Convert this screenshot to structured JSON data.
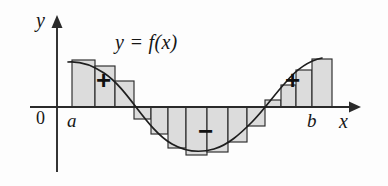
{
  "figure": {
    "equation_label": "y = f(x)",
    "axis": {
      "y_label": "y",
      "x_label": "x",
      "origin_label": "0",
      "lower_limit_label": "a",
      "upper_limit_label": "b"
    },
    "region_signs": {
      "left_positive": "+",
      "right_positive": "+",
      "middle_negative": "−"
    },
    "colors": {
      "bar_fill": "#dcdcdc",
      "bar_stroke": "#2b2b2b",
      "curve_stroke": "#1e1e1e",
      "axis_stroke": "#2a2a2a",
      "text": "#161616",
      "background": "#fdfdfd"
    }
  },
  "chart_data": {
    "type": "area",
    "title": "y = f(x)",
    "xlabel": "x",
    "ylabel": "y",
    "grid": false,
    "legend": false,
    "axis_baseline": 107,
    "x_axis_pixel_range": [
      30,
      355
    ],
    "y_axis_pixel_x": 57,
    "interval": {
      "a_pixel": 72,
      "b_pixel": 318
    },
    "curve_description": "Smooth sinusoid: positive hump from a, crossing down to a negative trough, rising back positive near b",
    "curve_points": [
      {
        "x": 72,
        "y": 62
      },
      {
        "x": 86,
        "y": 64
      },
      {
        "x": 100,
        "y": 70
      },
      {
        "x": 114,
        "y": 79
      },
      {
        "x": 128,
        "y": 92
      },
      {
        "x": 140,
        "y": 107
      },
      {
        "x": 152,
        "y": 121
      },
      {
        "x": 166,
        "y": 135
      },
      {
        "x": 182,
        "y": 146
      },
      {
        "x": 198,
        "y": 151
      },
      {
        "x": 214,
        "y": 150
      },
      {
        "x": 230,
        "y": 143
      },
      {
        "x": 246,
        "y": 131
      },
      {
        "x": 262,
        "y": 117
      },
      {
        "x": 274,
        "y": 107
      },
      {
        "x": 286,
        "y": 95
      },
      {
        "x": 300,
        "y": 79
      },
      {
        "x": 312,
        "y": 66
      },
      {
        "x": 322,
        "y": 60
      }
    ],
    "bars": [
      {
        "index": 1,
        "region": "positive-left",
        "x_left": 72,
        "x_right": 95,
        "top": 60,
        "bottom": 107,
        "signed_height": 47
      },
      {
        "index": 2,
        "region": "positive-left",
        "x_left": 95,
        "x_right": 115,
        "top": 66,
        "bottom": 107,
        "signed_height": 41
      },
      {
        "index": 3,
        "region": "positive-left",
        "x_left": 115,
        "x_right": 134,
        "top": 81,
        "bottom": 107,
        "signed_height": 26
      },
      {
        "index": 4,
        "region": "negative",
        "x_left": 134,
        "x_right": 151,
        "top": 107,
        "bottom": 119,
        "signed_height": -12
      },
      {
        "index": 5,
        "region": "negative",
        "x_left": 151,
        "x_right": 168,
        "top": 107,
        "bottom": 134,
        "signed_height": -27
      },
      {
        "index": 6,
        "region": "negative",
        "x_left": 168,
        "x_right": 186,
        "top": 107,
        "bottom": 148,
        "signed_height": -41
      },
      {
        "index": 7,
        "region": "negative",
        "x_left": 186,
        "x_right": 207,
        "top": 107,
        "bottom": 155,
        "signed_height": -48
      },
      {
        "index": 8,
        "region": "negative",
        "x_left": 207,
        "x_right": 228,
        "top": 107,
        "bottom": 152,
        "signed_height": -45
      },
      {
        "index": 9,
        "region": "negative",
        "x_left": 228,
        "x_right": 247,
        "top": 107,
        "bottom": 142,
        "signed_height": -35
      },
      {
        "index": 10,
        "region": "negative",
        "x_left": 247,
        "x_right": 265,
        "top": 107,
        "bottom": 126,
        "signed_height": -19
      },
      {
        "index": 11,
        "region": "positive-right",
        "x_left": 265,
        "x_right": 281,
        "top": 100,
        "bottom": 107,
        "signed_height": 7
      },
      {
        "index": 12,
        "region": "positive-right",
        "x_left": 281,
        "x_right": 296,
        "top": 85,
        "bottom": 107,
        "signed_height": 22
      },
      {
        "index": 13,
        "region": "positive-right",
        "x_left": 296,
        "x_right": 312,
        "top": 70,
        "bottom": 107,
        "signed_height": 37
      },
      {
        "index": 14,
        "region": "positive-right",
        "x_left": 312,
        "x_right": 332,
        "top": 59,
        "bottom": 107,
        "signed_height": 48
      }
    ],
    "annotations": [
      {
        "text": "+",
        "x": 105,
        "y": 80,
        "meaning": "positive signed area left"
      },
      {
        "text": "−",
        "x": 207,
        "y": 131,
        "meaning": "negative signed area middle"
      },
      {
        "text": "+",
        "x": 294,
        "y": 80,
        "meaning": "positive signed area right"
      }
    ]
  }
}
